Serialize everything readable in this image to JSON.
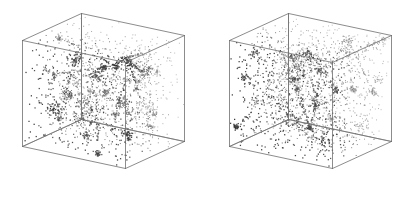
{
  "figure": {
    "type": "scatter-3d-pair",
    "title": "",
    "caption": "",
    "background_color": "#ffffff",
    "width": 414,
    "height": 214,
    "panel_count": 2,
    "has_axis_labels": false,
    "has_tick_labels": false,
    "has_legend": false,
    "has_text": false
  },
  "style": {
    "edge_color": "#6e6e6e",
    "edge_color_hidden": "#8f8f8f",
    "edge_width": 0.8,
    "point_color": "#3a3a3a",
    "point_color_light": "#9a9a9a",
    "point_size": 1.0,
    "page_background": "#ffffff"
  },
  "panels": [
    {
      "name": "left-panel",
      "label": "",
      "description": "3D cube wireframe containing clustered point distribution",
      "point_count": 2600,
      "cluster_seed": 11,
      "filament_strength": 0.62,
      "origin_x": 0,
      "cube": {
        "projection": "oblique",
        "vertices": {
          "front_top_left": [
            22,
            40
          ],
          "front_top_right": [
            125,
            62
          ],
          "front_bottom_left": [
            22,
            146
          ],
          "front_bottom_right": [
            125,
            168
          ],
          "back_top_left": [
            81,
            13
          ],
          "back_top_right": [
            184,
            35
          ],
          "back_bottom_left": [
            81,
            119
          ],
          "back_bottom_right": [
            184,
            141
          ]
        },
        "interior_vertex": [
          81,
          119
        ],
        "depth_offset_x": 59,
        "depth_offset_y": -27
      }
    },
    {
      "name": "right-panel",
      "label": "",
      "description": "3D cube wireframe containing clustered point distribution",
      "point_count": 2600,
      "cluster_seed": 47,
      "filament_strength": 0.48,
      "origin_x": 207,
      "cube": {
        "projection": "oblique",
        "vertices": {
          "front_top_left": [
            229,
            40
          ],
          "front_top_right": [
            332,
            62
          ],
          "front_bottom_left": [
            229,
            146
          ],
          "front_bottom_right": [
            332,
            168
          ],
          "back_top_left": [
            288,
            13
          ],
          "back_top_right": [
            391,
            35
          ],
          "back_bottom_left": [
            288,
            119
          ],
          "back_bottom_right": [
            391,
            141
          ]
        },
        "interior_vertex": [
          288,
          119
        ],
        "depth_offset_x": 59,
        "depth_offset_y": -27
      }
    }
  ],
  "chart_data": {
    "type": "scatter",
    "title": "",
    "subtitle": "",
    "xlabel": "",
    "ylabel": "",
    "zlabel": "",
    "grid": false,
    "legend_position": "none",
    "projection": "3d-oblique-cube",
    "axis_ranges": {
      "x": [
        0,
        1
      ],
      "y": [
        0,
        1
      ],
      "z": [
        0,
        1
      ]
    },
    "tick_labels": {
      "x": [],
      "y": [],
      "z": []
    },
    "annotations": [],
    "series": [
      {
        "name": "left-panel-points",
        "panel": 0,
        "n_points": 2600,
        "marker": "point",
        "color": "#3a3a3a",
        "size": 1.0,
        "distribution": "clustered-filamentary",
        "clusters": 34,
        "cluster_fraction": 0.62,
        "uniform_fraction": 0.38
      },
      {
        "name": "right-panel-points",
        "panel": 1,
        "n_points": 2600,
        "marker": "point",
        "color": "#3a3a3a",
        "size": 1.0,
        "distribution": "clustered-filamentary",
        "clusters": 30,
        "cluster_fraction": 0.48,
        "uniform_fraction": 0.52
      }
    ]
  }
}
